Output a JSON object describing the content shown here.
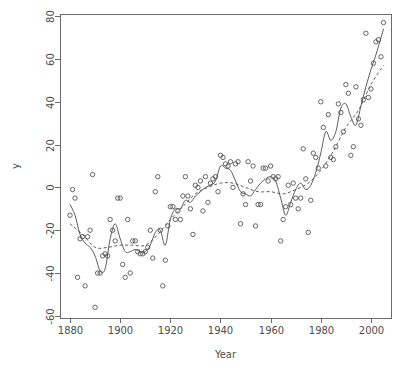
{
  "figure": {
    "background": "#ffffff",
    "width": 412,
    "height": 382,
    "plot_box": {
      "left": 60,
      "right": 391,
      "top": 14,
      "bottom": 318
    },
    "point_color": "#555555",
    "line_color": "#4a4a4a",
    "axis_color": "#6b6b6b",
    "label_color": "#4d4d4d"
  },
  "chart_data": {
    "type": "scatter",
    "title": "",
    "subtitle": "",
    "xlabel": "Year",
    "ylabel": "y",
    "xlim": [
      1876,
      2008
    ],
    "ylim": [
      -61,
      81
    ],
    "xticks": [
      1880,
      1900,
      1920,
      1940,
      1960,
      1980,
      2000
    ],
    "xtick_labels": [
      "1880",
      "1900",
      "1920",
      "1940",
      "1960",
      "1980",
      "2000"
    ],
    "yticks": [
      -60,
      -40,
      -20,
      0,
      20,
      40,
      60,
      80
    ],
    "ytick_labels": [
      "-60",
      "-40",
      "-20",
      "0",
      "20",
      "40",
      "60",
      "80"
    ],
    "grid": false,
    "legend": false,
    "legend_position": "none",
    "marker": "open-circle",
    "marker_size": 4.4,
    "annotations": [],
    "series": [
      {
        "name": "observations",
        "type": "scatter",
        "marker": "open-circle",
        "x": [
          1880,
          1881,
          1882,
          1883,
          1884,
          1885,
          1886,
          1887,
          1888,
          1889,
          1890,
          1891,
          1892,
          1893,
          1894,
          1895,
          1896,
          1897,
          1898,
          1899,
          1900,
          1901,
          1902,
          1903,
          1904,
          1905,
          1906,
          1907,
          1908,
          1909,
          1910,
          1911,
          1912,
          1913,
          1914,
          1915,
          1916,
          1917,
          1918,
          1919,
          1920,
          1921,
          1922,
          1923,
          1924,
          1925,
          1926,
          1927,
          1928,
          1929,
          1930,
          1931,
          1932,
          1933,
          1934,
          1935,
          1936,
          1937,
          1938,
          1939,
          1940,
          1941,
          1942,
          1943,
          1944,
          1945,
          1946,
          1947,
          1948,
          1949,
          1950,
          1951,
          1952,
          1953,
          1954,
          1955,
          1956,
          1957,
          1958,
          1959,
          1960,
          1961,
          1962,
          1963,
          1964,
          1965,
          1966,
          1967,
          1968,
          1969,
          1970,
          1971,
          1972,
          1973,
          1974,
          1975,
          1976,
          1977,
          1978,
          1979,
          1980,
          1981,
          1982,
          1983,
          1984,
          1985,
          1986,
          1987,
          1988,
          1989,
          1990,
          1991,
          1992,
          1993,
          1994,
          1995,
          1996,
          1997,
          1998,
          1999,
          2000,
          2001,
          2002,
          2003,
          2004,
          2005
        ],
        "y": [
          -13,
          -1,
          -5,
          -42,
          -24,
          -23,
          -46,
          -23,
          -20,
          6,
          -56,
          -40,
          -40,
          -32,
          -31,
          -32,
          -15,
          -20,
          -25,
          -5,
          -5,
          -36,
          -42,
          -15,
          -40,
          -25,
          -25,
          -30,
          -31,
          -31,
          -30,
          -28,
          -20,
          -33,
          -2,
          5,
          -20,
          -46,
          -34,
          -18,
          -9,
          -9,
          -15,
          -11,
          -15,
          -4,
          5,
          -4,
          -10,
          -22,
          1,
          0,
          3,
          -11,
          5,
          -7,
          2,
          4,
          5,
          -2,
          15,
          14,
          11,
          10,
          12,
          0,
          11,
          12,
          -17,
          -3,
          -8,
          12,
          3,
          10,
          -18,
          -8,
          -8,
          9,
          9,
          3,
          10,
          5,
          4,
          5,
          -25,
          -15,
          -9,
          1,
          -8,
          2,
          -5,
          -10,
          -5,
          18,
          4,
          -21,
          -6,
          16,
          14,
          9,
          40,
          28,
          10,
          34,
          14,
          13,
          19,
          39,
          35,
          26,
          48,
          44,
          15,
          19,
          47,
          32,
          29,
          41,
          72,
          42,
          46,
          58,
          68,
          69,
          61,
          77
        ]
      },
      {
        "name": "wiggly-smoother",
        "type": "line",
        "style": "solid",
        "x": [
          1880,
          1882,
          1884,
          1886,
          1888,
          1890,
          1892,
          1894,
          1896,
          1898,
          1900,
          1902,
          1904,
          1906,
          1908,
          1910,
          1912,
          1914,
          1916,
          1918,
          1920,
          1922,
          1924,
          1926,
          1928,
          1930,
          1932,
          1934,
          1936,
          1938,
          1940,
          1942,
          1944,
          1946,
          1948,
          1950,
          1952,
          1954,
          1956,
          1958,
          1960,
          1962,
          1964,
          1966,
          1968,
          1970,
          1972,
          1974,
          1976,
          1978,
          1980,
          1982,
          1984,
          1986,
          1988,
          1990,
          1992,
          1994,
          1996,
          1998,
          2000,
          2002,
          2004,
          2005
        ],
        "y": [
          -8,
          -13,
          -22,
          -26,
          -28,
          -32,
          -39,
          -38,
          -24,
          -17,
          -24,
          -30,
          -30,
          -29,
          -30,
          -30,
          -27,
          -21,
          -20,
          -27,
          -15,
          -10,
          -10,
          -6,
          -7,
          -4,
          -2,
          0,
          1,
          3,
          10,
          9,
          8,
          3,
          -2,
          -3,
          -4,
          -1,
          2,
          4,
          5,
          3,
          -5,
          -13,
          -7,
          -1,
          2,
          -1,
          1,
          7,
          16,
          26,
          22,
          26,
          37,
          39,
          33,
          29,
          38,
          47,
          55,
          62,
          70,
          74
        ]
      },
      {
        "name": "smooth-trend",
        "type": "line",
        "style": "dashed",
        "x": [
          1880,
          1885,
          1890,
          1895,
          1900,
          1905,
          1910,
          1915,
          1920,
          1925,
          1930,
          1935,
          1940,
          1945,
          1950,
          1955,
          1960,
          1965,
          1970,
          1975,
          1980,
          1985,
          1990,
          1995,
          2000,
          2005
        ],
        "y": [
          -17,
          -22,
          -28,
          -28,
          -27,
          -27,
          -27,
          -22,
          -15,
          -9,
          -3,
          0,
          2,
          2,
          0,
          -2,
          -2,
          -3,
          -1,
          2,
          8,
          17,
          28,
          36,
          48,
          57
        ]
      }
    ]
  }
}
